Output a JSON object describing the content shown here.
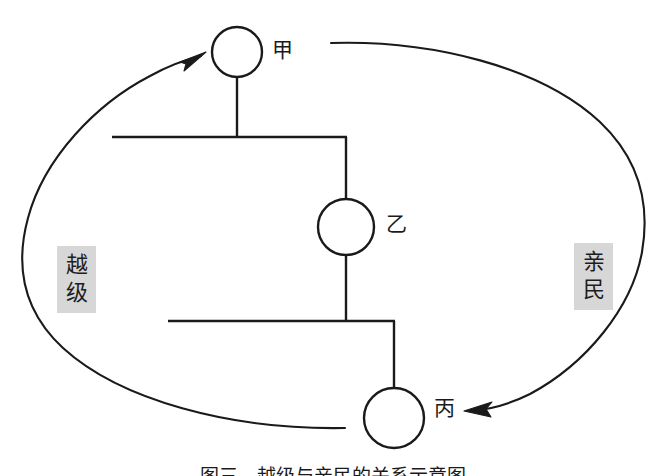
{
  "diagram": {
    "type": "hierarchy-with-feedback-loop",
    "background_color": "#ffffff",
    "line_color": "#1a1a1a",
    "label_box_color": "#d7d7d7",
    "nodes": [
      {
        "id": "jia",
        "label": "甲",
        "level": 1,
        "cx": 237,
        "cy": 52,
        "r": 25
      },
      {
        "id": "yi",
        "label": "乙",
        "level": 2,
        "cx": 346,
        "cy": 227,
        "r": 28
      },
      {
        "id": "bing",
        "label": "丙",
        "level": 3,
        "cx": 394,
        "cy": 418,
        "r": 30
      }
    ],
    "side_labels": [
      {
        "id": "yueji",
        "text": "越级",
        "chars": [
          "越",
          "级"
        ],
        "side": "left"
      },
      {
        "id": "qinmin",
        "text": "亲民",
        "chars": [
          "亲",
          "民"
        ],
        "side": "right"
      }
    ],
    "arrows": [
      {
        "id": "arrow-to-jia",
        "from": "bing",
        "to": "jia",
        "direction": "counter-clockwise-left",
        "head_at": [
          201,
          55
        ]
      },
      {
        "id": "arrow-to-bing",
        "from": "jia",
        "to": "bing",
        "direction": "clockwise-right",
        "head_at": [
          470,
          411
        ]
      }
    ],
    "caption": "图三　越级与亲民的关系示意图"
  }
}
